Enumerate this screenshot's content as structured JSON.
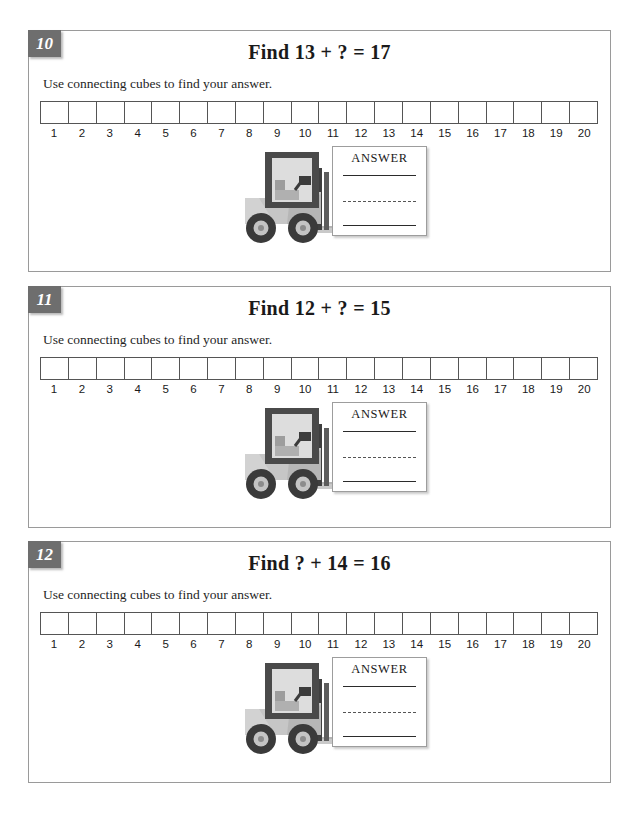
{
  "worksheet": {
    "number_line": {
      "labels": [
        "1",
        "2",
        "3",
        "4",
        "5",
        "6",
        "7",
        "8",
        "9",
        "10",
        "11",
        "12",
        "13",
        "14",
        "15",
        "16",
        "17",
        "18",
        "19",
        "20"
      ],
      "cell_count": 20
    },
    "answer_box_label": "ANSWER",
    "problems": [
      {
        "badge": "10",
        "title": "Find 13 + ? = 17",
        "instruction": "Use connecting cubes to find your answer.",
        "answer_label": "ANSWER"
      },
      {
        "badge": "11",
        "title": "Find 12 + ? = 15",
        "instruction": "Use connecting cubes to find your answer.",
        "answer_label": "ANSWER"
      },
      {
        "badge": "12",
        "title": "Find ? + 14 = 16",
        "instruction": "Use connecting cubes to find your answer.",
        "answer_label": "ANSWER"
      }
    ],
    "icons": {
      "forklift": "forklift-icon"
    },
    "colors": {
      "badge_bg": "#6e6e6e",
      "badge_text": "#ffffff",
      "panel_border": "#9a9a9a",
      "cell_border": "#555555",
      "text": "#1a1a1a",
      "forklift_body": "#c8c8c8",
      "forklift_dark": "#4a4a4a",
      "forklift_light": "#d9d9d9",
      "forklift_tire": "#3c3c3c"
    }
  }
}
